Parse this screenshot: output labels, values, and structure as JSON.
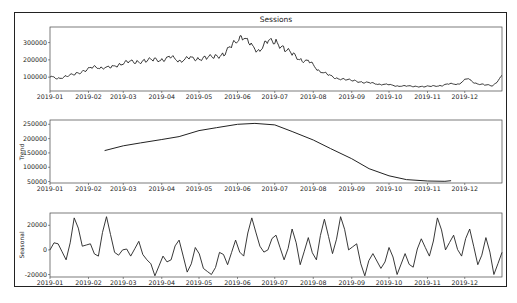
{
  "chart_data": [
    {
      "type": "line",
      "title": "Sessions",
      "xlabel": "",
      "ylabel": "",
      "x_ticks": [
        "2019-01",
        "2019-02",
        "2019-03",
        "2019-04",
        "2019-05",
        "2019-06",
        "2019-07",
        "2019-08",
        "2019-09",
        "2019-10",
        "2019-11",
        "2019-12"
      ],
      "y_ticks": [
        100000,
        200000,
        300000
      ],
      "ylim": [
        20000,
        390000
      ],
      "grid": false,
      "series": [
        {
          "name": "Sessions",
          "x": [
            "2019-01-01",
            "2019-01-08",
            "2019-01-15",
            "2019-01-22",
            "2019-01-29",
            "2019-02-05",
            "2019-02-12",
            "2019-02-19",
            "2019-02-26",
            "2019-03-05",
            "2019-03-12",
            "2019-03-19",
            "2019-03-26",
            "2019-04-02",
            "2019-04-09",
            "2019-04-16",
            "2019-04-23",
            "2019-04-30",
            "2019-05-07",
            "2019-05-14",
            "2019-05-21",
            "2019-05-28",
            "2019-06-04",
            "2019-06-11",
            "2019-06-18",
            "2019-06-25",
            "2019-07-02",
            "2019-07-09",
            "2019-07-16",
            "2019-07-23",
            "2019-07-30",
            "2019-08-06",
            "2019-08-13",
            "2019-08-20",
            "2019-08-27",
            "2019-09-03",
            "2019-09-10",
            "2019-09-17",
            "2019-09-24",
            "2019-10-01",
            "2019-10-08",
            "2019-10-15",
            "2019-10-22",
            "2019-10-29",
            "2019-11-05",
            "2019-11-12",
            "2019-11-19",
            "2019-11-26",
            "2019-12-03",
            "2019-12-10",
            "2019-12-17",
            "2019-12-24",
            "2019-12-31"
          ],
          "values": [
            100000,
            95000,
            105000,
            120000,
            140000,
            155000,
            160000,
            150000,
            180000,
            185000,
            190000,
            195000,
            200000,
            205000,
            210000,
            200000,
            205000,
            210000,
            210000,
            220000,
            235000,
            280000,
            350000,
            280000,
            260000,
            300000,
            310000,
            260000,
            230000,
            200000,
            180000,
            140000,
            110000,
            95000,
            85000,
            80000,
            70000,
            65000,
            60000,
            55000,
            50000,
            48000,
            47000,
            45000,
            48000,
            52000,
            60000,
            62000,
            90000,
            65000,
            55000,
            50000,
            110000
          ]
        }
      ]
    },
    {
      "type": "line",
      "title": "",
      "xlabel": "",
      "ylabel": "Trend",
      "x_ticks": [
        "2019-01",
        "2019-02",
        "2019-03",
        "2019-04",
        "2019-05",
        "2019-06",
        "2019-07",
        "2019-08",
        "2019-09",
        "2019-10",
        "2019-11",
        "2019-12"
      ],
      "y_ticks": [
        50000,
        100000,
        150000,
        200000,
        250000
      ],
      "ylim": [
        45000,
        265000
      ],
      "grid": false,
      "series": [
        {
          "name": "Trend",
          "x": [
            "2019-02-14",
            "2019-03-01",
            "2019-03-15",
            "2019-04-01",
            "2019-04-15",
            "2019-05-01",
            "2019-05-15",
            "2019-06-01",
            "2019-06-15",
            "2019-07-01",
            "2019-07-15",
            "2019-08-01",
            "2019-08-15",
            "2019-09-01",
            "2019-09-15",
            "2019-10-01",
            "2019-10-15",
            "2019-11-01",
            "2019-11-15",
            "2019-11-20"
          ],
          "values": [
            158000,
            175000,
            185000,
            197000,
            207000,
            228000,
            238000,
            250000,
            253000,
            248000,
            225000,
            195000,
            165000,
            130000,
            95000,
            70000,
            57000,
            52000,
            51000,
            53000
          ]
        }
      ]
    },
    {
      "type": "line",
      "title": "",
      "xlabel": "",
      "ylabel": "Seasonal",
      "x_ticks": [
        "2019-01",
        "2019-02",
        "2019-03",
        "2019-04",
        "2019-05",
        "2019-06",
        "2019-07",
        "2019-08",
        "2019-09",
        "2019-10",
        "2019-11",
        "2019-12"
      ],
      "y_ticks": [
        -20000,
        0,
        20000
      ],
      "ylim": [
        -22000,
        30000
      ],
      "grid": false,
      "series": [
        {
          "name": "Seasonal",
          "period_days": 91,
          "pattern": "oscillating weekly peaks ~+27000, troughs ~-21000, repeating roughly every quarter",
          "values": [
            0,
            5000,
            -8000,
            26000,
            3000,
            5000,
            -5000,
            27000,
            -2000,
            0,
            -5000,
            7000,
            -8000,
            -21000,
            -5000,
            -8000,
            8000,
            -18000,
            2000,
            -15000,
            -20000,
            -2000,
            -12000,
            8000,
            -5000,
            26000,
            3000,
            0,
            12000,
            -8000,
            17000,
            -12000,
            10000,
            -8000,
            25000,
            -3000,
            27000,
            0,
            5000,
            -21000,
            -3000,
            -15000,
            2000,
            -20000,
            -3000,
            -14000,
            9000,
            -5000,
            26000,
            0,
            12000,
            -5000,
            17000,
            -12000,
            10000,
            -20000,
            -2000
          ]
        }
      ]
    }
  ]
}
